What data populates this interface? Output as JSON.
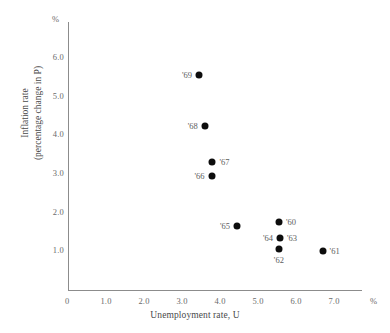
{
  "chart_data": {
    "type": "scatter",
    "title": "",
    "xlabel": "Unemployment rate, U",
    "ylabel_line1": "Inflation rate",
    "ylabel_line2": "(percentage change in P)",
    "x_unit": "%",
    "y_unit": "%",
    "xlim": [
      0,
      7.7
    ],
    "ylim": [
      0,
      6.9
    ],
    "grid": false,
    "legend": "none",
    "x_ticks": [
      "0",
      "1.0",
      "2.0",
      "3.0",
      "4.0",
      "5.0",
      "6.0",
      "7.0"
    ],
    "x_tick_values": [
      0,
      1.0,
      2.0,
      3.0,
      4.0,
      5.0,
      6.0,
      7.0
    ],
    "y_ticks": [
      "1.0",
      "2.0",
      "3.0",
      "4.0",
      "5.0",
      "6.0"
    ],
    "y_tick_values": [
      1.0,
      2.0,
      3.0,
      4.0,
      5.0,
      6.0
    ],
    "y_origin_label": "0",
    "points": [
      {
        "label": "'69",
        "x": 3.45,
        "y": 5.55,
        "label_pos": "left"
      },
      {
        "label": "'68",
        "x": 3.6,
        "y": 4.25,
        "label_pos": "left"
      },
      {
        "label": "'67",
        "x": 3.8,
        "y": 3.3,
        "label_pos": "right"
      },
      {
        "label": "'66",
        "x": 3.78,
        "y": 2.95,
        "label_pos": "left"
      },
      {
        "label": "'65",
        "x": 4.45,
        "y": 1.65,
        "label_pos": "left"
      },
      {
        "label": "'60",
        "x": 5.55,
        "y": 1.75,
        "label_pos": "right"
      },
      {
        "label": "'63",
        "x": 5.58,
        "y": 1.35,
        "label_pos": "right"
      },
      {
        "label": "'64",
        "x": 5.58,
        "y": 1.35,
        "label_pos": "left"
      },
      {
        "label": "'62",
        "x": 5.55,
        "y": 1.05,
        "label_pos": "below"
      },
      {
        "label": "'61",
        "x": 6.7,
        "y": 1.02,
        "label_pos": "right"
      }
    ]
  }
}
